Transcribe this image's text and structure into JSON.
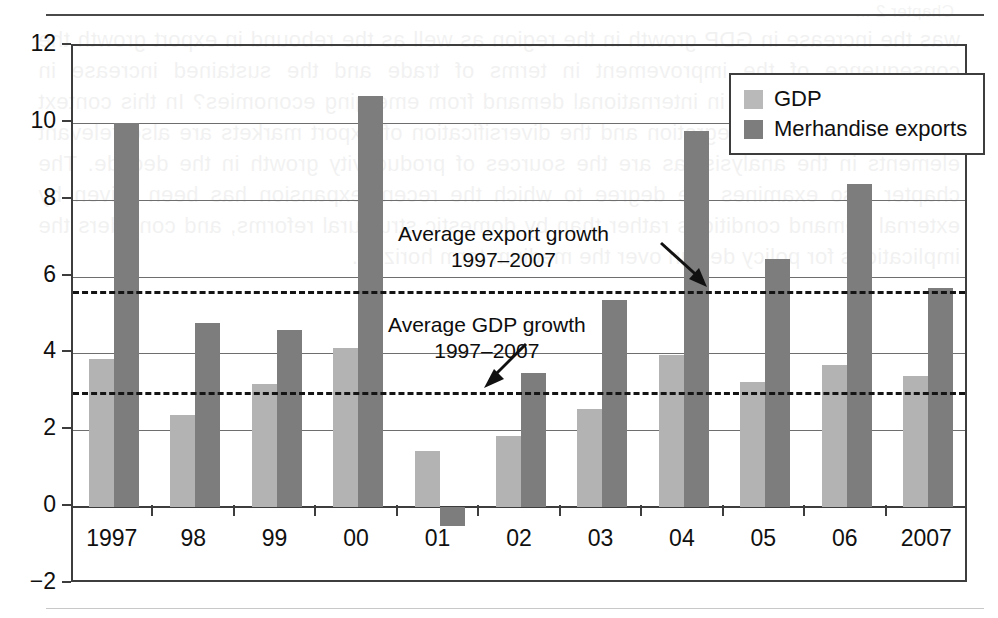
{
  "page": {
    "bleed_heading": "Chapter 2 ...",
    "bleed_body": "was the increase in GDP growth in the region as well as the rebound in export growth the consequence of the improvement in terms of trade and the sustained increase in commodity prices and in international demand from emerging economies? In this context the role of regional integration and the diversification of export markets are also relevant elements in the analysis, as are the sources of productivity growth in the decade. The chapter also examines the degree to which the recent expansion has been driven by external demand conditions rather than by domestic structural reforms, and considers the implications for policy design over the medium term horizon."
  },
  "chart_data": {
    "type": "bar",
    "title": "",
    "subtitle": "",
    "xlabel": "",
    "ylabel": "",
    "categories": [
      "1997",
      "98",
      "99",
      "00",
      "01",
      "02",
      "03",
      "04",
      "05",
      "06",
      "2007"
    ],
    "series": [
      {
        "name": "GDP",
        "color": "#b3b3b3",
        "values": [
          3.85,
          2.4,
          3.2,
          4.15,
          1.45,
          1.85,
          2.55,
          3.95,
          3.25,
          3.7,
          3.4
        ]
      },
      {
        "name": "Merhandise exports",
        "color": "#7d7d7d",
        "values": [
          10.0,
          4.8,
          4.6,
          10.7,
          -0.5,
          3.5,
          5.4,
          9.8,
          6.45,
          8.4,
          5.7
        ]
      }
    ],
    "ylim": [
      -2,
      12
    ],
    "ytick_values": [
      -2,
      0,
      2,
      4,
      6,
      8,
      10,
      12
    ],
    "ytick_labels": [
      "−2",
      "0",
      "2",
      "4",
      "6",
      "8",
      "10",
      "12"
    ],
    "grid": true,
    "legend_position": "top-right",
    "reference_lines": [
      {
        "id": "avg-export",
        "value": 5.62,
        "style": "dashed",
        "label_line1": "Average export growth",
        "label_line2": "1997–2007"
      },
      {
        "id": "avg-gdp",
        "value": 3.0,
        "style": "dashed",
        "label_line1": "Average GDP growth",
        "label_line2": "1997–2007"
      }
    ]
  },
  "legend": {
    "items": [
      {
        "label": "GDP",
        "swatch": "gdp"
      },
      {
        "label": "Merhandise exports",
        "swatch": "exp"
      }
    ]
  }
}
